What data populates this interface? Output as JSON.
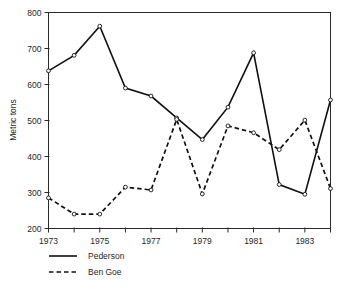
{
  "chart_data": {
    "type": "line",
    "title": "",
    "xlabel": "",
    "ylabel": "Metric tons",
    "ylim": [
      200,
      800
    ],
    "xlim": [
      1973,
      1984
    ],
    "yticks": [
      200,
      300,
      400,
      500,
      600,
      700,
      800
    ],
    "ytick_labels": [
      "200",
      "300",
      "400",
      "500",
      "600",
      "700",
      "800"
    ],
    "x": [
      1973,
      1974,
      1975,
      1976,
      1977,
      1978,
      1979,
      1980,
      1981,
      1982,
      1983,
      1984
    ],
    "xticks": [
      1973,
      1974,
      1975,
      1976,
      1977,
      1978,
      1979,
      1980,
      1981,
      1982,
      1983,
      1984
    ],
    "xtick_labels": [
      "1973",
      "",
      "1975",
      "",
      "1977",
      "",
      "1979",
      "",
      "1981",
      "",
      "1983",
      ""
    ],
    "xtick_labels_shown": [
      "1973",
      "1975",
      "1977",
      "1979",
      "1981",
      "1983"
    ],
    "grid": false,
    "legend_position": "below-left",
    "marker": "open-circle",
    "series": [
      {
        "name": "Pederson",
        "style": "solid",
        "color": "#111111",
        "values": [
          638,
          681,
          762,
          590,
          568,
          507,
          447,
          537,
          688,
          322,
          295,
          557
        ]
      },
      {
        "name": "Ben Goe",
        "style": "dashed",
        "color": "#111111",
        "values": [
          285,
          240,
          240,
          315,
          307,
          503,
          296,
          485,
          466,
          419,
          501,
          311
        ]
      }
    ]
  },
  "axes": {
    "ylabel": "Metric tons"
  },
  "legend": {
    "entries": [
      {
        "label": "Pederson",
        "style": "solid"
      },
      {
        "label": "Ben Goe",
        "style": "dashed"
      }
    ]
  }
}
